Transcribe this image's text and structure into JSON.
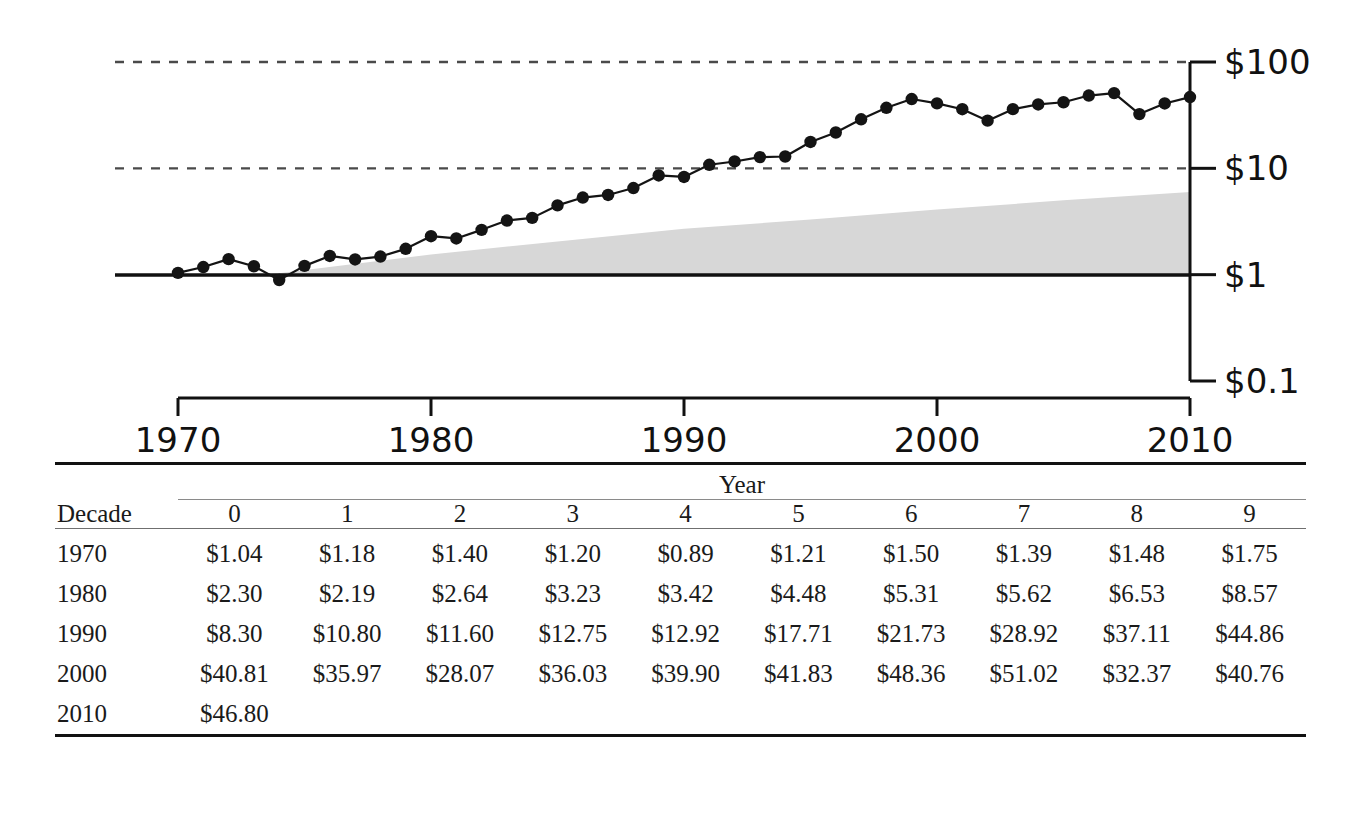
{
  "chart_data": {
    "type": "line",
    "title": "",
    "xlabel": "",
    "ylabel": "",
    "y_scale": "log",
    "ylim": [
      0.1,
      100
    ],
    "xlim": [
      1968,
      2011
    ],
    "grid": "dashed horizontal gridlines at $100 and $10; solid reference line at $1",
    "legend": "none",
    "y_tick_labels": [
      "$100",
      "$10",
      "$1",
      "$0.1"
    ],
    "y_tick_values": [
      100,
      10,
      1,
      0.1
    ],
    "x_tick_labels": [
      "1970",
      "1980",
      "1990",
      "2000",
      "2010"
    ],
    "x_tick_values": [
      1970,
      1980,
      1990,
      2000,
      2010
    ],
    "series": [
      {
        "name": "price",
        "marker": "filled-circle",
        "x": [
          1970,
          1971,
          1972,
          1973,
          1974,
          1975,
          1976,
          1977,
          1978,
          1979,
          1980,
          1981,
          1982,
          1983,
          1984,
          1985,
          1986,
          1987,
          1988,
          1989,
          1990,
          1991,
          1992,
          1993,
          1994,
          1995,
          1996,
          1997,
          1998,
          1999,
          2000,
          2001,
          2002,
          2003,
          2004,
          2005,
          2006,
          2007,
          2008,
          2009,
          2010
        ],
        "values": [
          1.04,
          1.18,
          1.4,
          1.2,
          0.89,
          1.21,
          1.5,
          1.39,
          1.48,
          1.75,
          2.3,
          2.19,
          2.64,
          3.23,
          3.42,
          4.48,
          5.31,
          5.62,
          6.53,
          8.57,
          8.3,
          10.8,
          11.6,
          12.75,
          12.92,
          17.71,
          21.73,
          28.92,
          37.11,
          44.86,
          40.81,
          35.97,
          28.07,
          36.03,
          39.9,
          41.83,
          48.36,
          51.02,
          32.37,
          40.76,
          46.8
        ]
      }
    ],
    "band": {
      "name": "shaded-band",
      "color": "#d7d7d7",
      "x": [
        1973.5,
        1980,
        1985,
        1990,
        1995,
        2000,
        2005,
        2010
      ],
      "lower": [
        1.0,
        1.0,
        1.0,
        1.0,
        1.0,
        1.0,
        1.0,
        1.0
      ],
      "upper": [
        1.0,
        1.55,
        2.05,
        2.7,
        3.3,
        4.1,
        5.0,
        6.0
      ]
    }
  },
  "table": {
    "spanner_header": "Year",
    "row_header": "Decade",
    "year_columns": [
      "0",
      "1",
      "2",
      "3",
      "4",
      "5",
      "6",
      "7",
      "8",
      "9"
    ],
    "rows": [
      {
        "decade": "1970",
        "cells": [
          "$1.04",
          "$1.18",
          "$1.40",
          "$1.20",
          "$0.89",
          "$1.21",
          "$1.50",
          "$1.39",
          "$1.48",
          "$1.75"
        ]
      },
      {
        "decade": "1980",
        "cells": [
          "$2.30",
          "$2.19",
          "$2.64",
          "$3.23",
          "$3.42",
          "$4.48",
          "$5.31",
          "$5.62",
          "$6.53",
          "$8.57"
        ]
      },
      {
        "decade": "1990",
        "cells": [
          "$8.30",
          "$10.80",
          "$11.60",
          "$12.75",
          "$12.92",
          "$17.71",
          "$21.73",
          "$28.92",
          "$37.11",
          "$44.86"
        ]
      },
      {
        "decade": "2000",
        "cells": [
          "$40.81",
          "$35.97",
          "$28.07",
          "$36.03",
          "$39.90",
          "$41.83",
          "$48.36",
          "$51.02",
          "$32.37",
          "$40.76"
        ]
      },
      {
        "decade": "2010",
        "cells": [
          "$46.80",
          "",
          "",
          "",
          "",
          "",
          "",
          "",
          "",
          ""
        ]
      }
    ]
  },
  "colors": {
    "ink": "#141414",
    "band": "#d7d7d7",
    "grid": "#4a4a4a",
    "rule": "#111111"
  }
}
